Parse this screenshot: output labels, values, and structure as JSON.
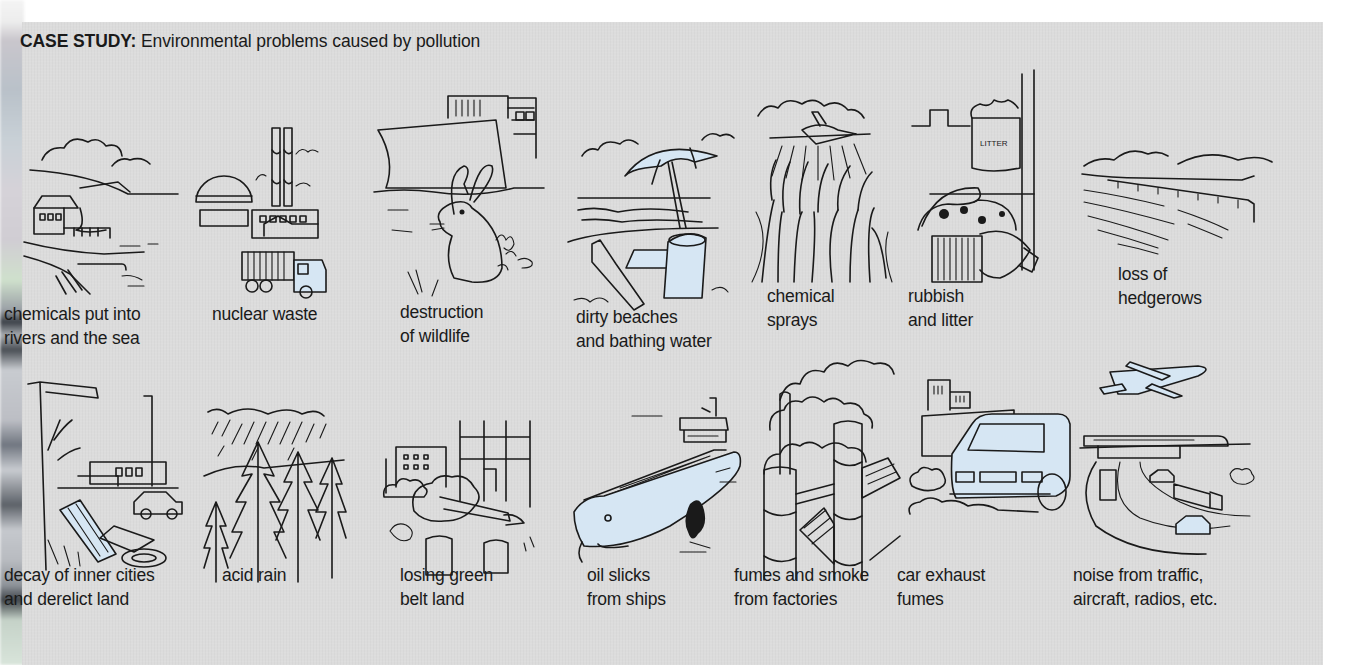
{
  "page": {
    "title_bold": "CASE STUDY:",
    "title_rest": " Environmental problems caused by pollution",
    "accent_fill": "#d6e6f3",
    "panel_color": "#dcdcdc"
  },
  "row1": [
    {
      "id": "chemicals-rivers",
      "icon": "river-factory-pipe",
      "lines": [
        "chemicals put into",
        "rivers and the sea"
      ]
    },
    {
      "id": "nuclear-waste",
      "icon": "nuclear-plant-truck",
      "lines": [
        "nuclear waste"
      ]
    },
    {
      "id": "destruction-wildlife",
      "icon": "rabbit-bulldozer",
      "lines": [
        "destruction",
        "of wildlife"
      ]
    },
    {
      "id": "dirty-beaches",
      "icon": "beach-umbrella-litter",
      "lines": [
        "dirty beaches",
        "and bathing water"
      ]
    },
    {
      "id": "chemical-sprays",
      "icon": "crop-duster-plane",
      "lines": [
        "chemical",
        "sprays"
      ]
    },
    {
      "id": "rubbish-litter",
      "icon": "overflowing-bin",
      "lines": [
        "rubbish",
        "and litter"
      ],
      "sign_text": "LITTER"
    },
    {
      "id": "loss-hedgerows",
      "icon": "open-fields",
      "lines": [
        "loss of",
        "hedgerows"
      ]
    }
  ],
  "row2": [
    {
      "id": "decay-inner-cities",
      "icon": "derelict-lot",
      "lines": [
        "decay of inner cities",
        "and derelict land"
      ]
    },
    {
      "id": "acid-rain",
      "icon": "rain-forest",
      "lines": [
        "acid rain"
      ]
    },
    {
      "id": "green-belt",
      "icon": "felled-trees-construction",
      "lines": [
        "losing green",
        "belt land"
      ]
    },
    {
      "id": "oil-slicks",
      "icon": "oil-tanker",
      "lines": [
        "oil slicks",
        "from ships"
      ]
    },
    {
      "id": "fumes-factories",
      "icon": "smoking-chimneys",
      "lines": [
        "fumes and smoke",
        "from factories"
      ]
    },
    {
      "id": "car-exhaust",
      "icon": "car-exhaust-smoke",
      "lines": [
        "car exhaust",
        "fumes"
      ]
    },
    {
      "id": "noise-traffic",
      "icon": "plane-train-motorway",
      "lines": [
        "noise from traffic,",
        "aircraft, radios, etc."
      ]
    }
  ]
}
